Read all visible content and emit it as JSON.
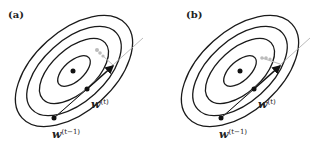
{
  "panels": [
    {
      "id": "a",
      "label": "(a)",
      "point_labels": {
        "current": "w",
        "current_sup": "(t)",
        "previous": "w",
        "previous_sup": "(t−1)"
      }
    },
    {
      "id": "b",
      "label": "(b)",
      "point_labels": {
        "current": "w",
        "current_sup": "(t)",
        "previous": "w",
        "previous_sup": "(t−1)"
      }
    }
  ],
  "colors": {
    "contour": "#1a1a1a",
    "guide_line": "#aaaaaa",
    "faded_step": "#bbbbbb",
    "arrow": "#111111"
  }
}
